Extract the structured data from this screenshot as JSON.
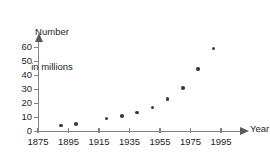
{
  "chart_data": {
    "type": "scatter",
    "title": "",
    "ylabel": "Number in millions",
    "ylabel_lines": [
      "Number",
      "in millions"
    ],
    "xlabel": "Year",
    "xlim": [
      1875,
      2000
    ],
    "ylim": [
      0,
      63
    ],
    "grid": false,
    "legend": null,
    "x_ticks": [
      1875,
      1895,
      1915,
      1935,
      1955,
      1975,
      1995
    ],
    "x_tick_labels": [
      "1875",
      "1895",
      "1915",
      "1935",
      "1955",
      "1975",
      "1995"
    ],
    "y_ticks": [
      0,
      10,
      20,
      30,
      40,
      50,
      60
    ],
    "y_tick_labels": [
      "0",
      "10",
      "20",
      "30",
      "40",
      "50",
      "60"
    ],
    "x": [
      1890,
      1900,
      1920,
      1930,
      1940,
      1950,
      1960,
      1970,
      1980,
      1990
    ],
    "values": [
      4,
      5,
      9,
      11,
      13.5,
      17,
      23,
      31,
      44.5,
      59
    ],
    "points": [
      {
        "x": 1890,
        "y": 4
      },
      {
        "x": 1900,
        "y": 5
      },
      {
        "x": 1920,
        "y": 9
      },
      {
        "x": 1930,
        "y": 11
      },
      {
        "x": 1940,
        "y": 13.5
      },
      {
        "x": 1950,
        "y": 17
      },
      {
        "x": 1960,
        "y": 23
      },
      {
        "x": 1970,
        "y": 31
      },
      {
        "x": 1980,
        "y": 44.5
      },
      {
        "x": 1990,
        "y": 59
      }
    ],
    "colors": {
      "point": "#3b3b3d",
      "axis": "#808285",
      "text": "#231f20",
      "background": "#ffffff"
    }
  }
}
